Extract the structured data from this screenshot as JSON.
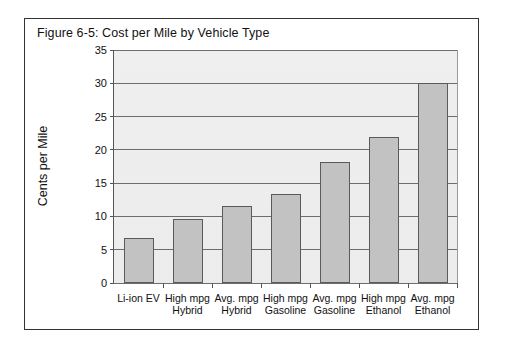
{
  "figure": {
    "title": "Figure 6-5:  Cost per Mile by Vehicle Type"
  },
  "chart_data": {
    "type": "bar",
    "title": "Figure 6-5:  Cost per Mile by Vehicle Type",
    "xlabel": "",
    "ylabel": "Cents per Mile",
    "ylim": [
      0,
      35
    ],
    "ytick_step": 5,
    "yticks": [
      0,
      5,
      10,
      15,
      20,
      25,
      30,
      35
    ],
    "ytick_labels": [
      "0",
      "5",
      "10",
      "15",
      "20",
      "25",
      "30",
      "35"
    ],
    "grid": true,
    "legend": false,
    "bar_color": "#c2c2c2",
    "bar_edge_color": "#5a5a5a",
    "plot_background": "#efefef",
    "categories": [
      "Li-ion EV",
      "High mpg Hybrid",
      "Avg. mpg Hybrid",
      "High mpg Gasoline",
      "Avg. mpg Gasoline",
      "High mpg Ethanol",
      "Avg. mpg Ethanol"
    ],
    "category_lines": [
      [
        "Li-ion EV",
        ""
      ],
      [
        "High mpg",
        "Hybrid"
      ],
      [
        "Avg. mpg",
        "Hybrid"
      ],
      [
        "High mpg",
        "Gasoline"
      ],
      [
        "Avg. mpg",
        "Gasoline"
      ],
      [
        "High mpg",
        "Ethanol"
      ],
      [
        "Avg. mpg",
        "Ethanol"
      ]
    ],
    "values": [
      6.8,
      9.6,
      11.5,
      13.4,
      18.2,
      22.0,
      30.0
    ]
  }
}
